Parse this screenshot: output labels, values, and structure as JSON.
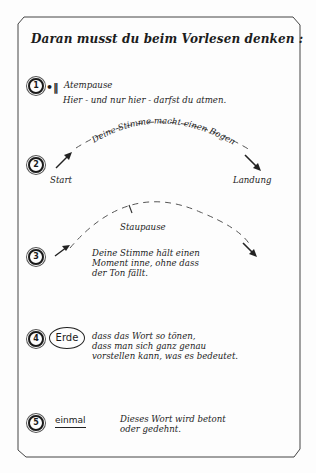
{
  "title": "Daran musst du beim Vorlesen denken :",
  "items": [
    {
      "number": "1",
      "symbol": "•‖",
      "label": "Atempause",
      "description": "Hier - und nur hier - darfst du atmen."
    },
    {
      "number": "2",
      "arc_text": "Deine Stimme macht einen Bogen",
      "start_label": "Start",
      "end_label": "Landung"
    },
    {
      "number": "3",
      "label": "Staupause",
      "description_lines": [
        "Deine Stimme hält einen",
        "Moment inne, ohne dass",
        "der Ton fällt."
      ]
    },
    {
      "number": "4",
      "example_word": "Erde",
      "description_lines": [
        "dass das Wort so tönen,",
        "dass man sich ganz genau",
        "vorstellen kann, was es bedeutet."
      ]
    },
    {
      "number": "5",
      "example_word": "einmal",
      "description_lines": [
        "Dieses Wort wird betont",
        "oder gedehnt."
      ]
    }
  ],
  "colors": {
    "ink": "#1a1a1a",
    "paper": "#fdfdfd",
    "frame": "#555555"
  }
}
